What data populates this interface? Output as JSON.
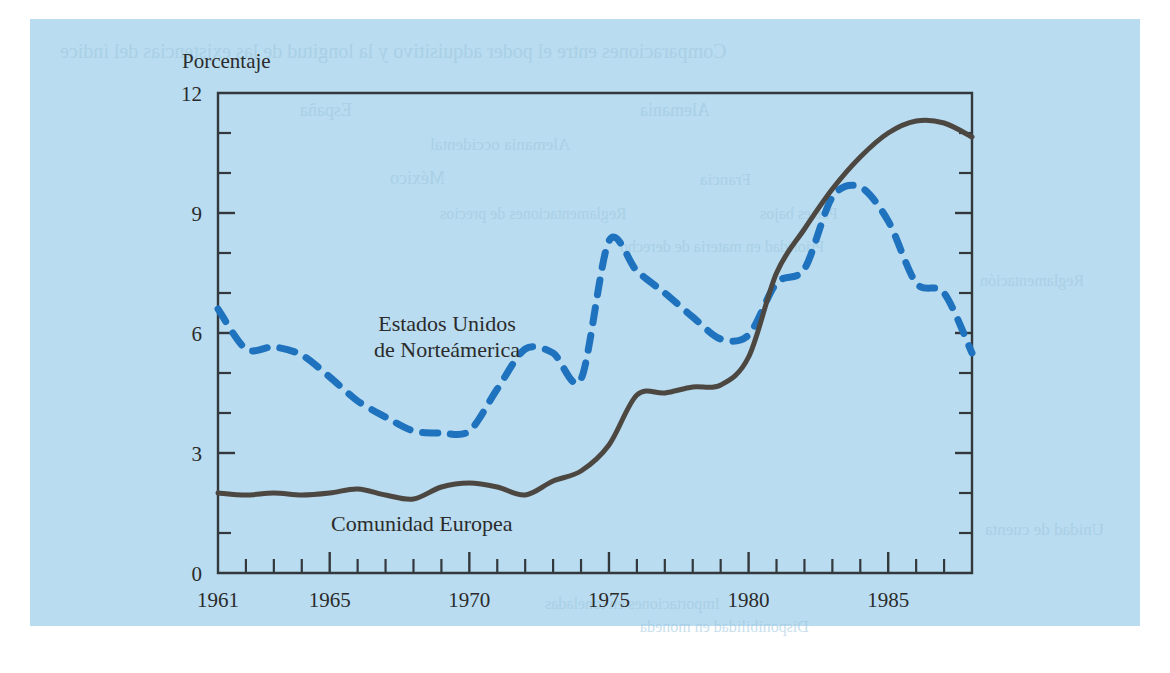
{
  "figure": {
    "background_color": "#b9dcf0",
    "page_color": "#ffffff",
    "axis_color": "#33383c"
  },
  "bleed_text": {
    "line1": "Comparaciones entre el poder adquisitivo y la longitud de las existencias del índice",
    "line2": "Alemania",
    "line3": "España",
    "line4": "Alemania occidental",
    "line5": "México",
    "line6": "Francia",
    "line7": "Reglamentaciones de precios",
    "line8": "Países bajos",
    "line9": "Prioridad en materia de derecho",
    "line10": "Reglamentación",
    "line11": "Unidad de cuenta",
    "line12": "Importaciones en toneladas",
    "line13": "Disponibilidad en moneda"
  },
  "chart_data": {
    "type": "line",
    "title": "",
    "ylabel": "Porcentaje",
    "xlabel": "",
    "xlim": [
      1961,
      1988
    ],
    "ylim": [
      0,
      12
    ],
    "yticks": [
      0,
      3,
      6,
      9,
      12
    ],
    "ytick_labels": [
      "0",
      "3",
      "6",
      "9",
      "12"
    ],
    "yminor_step": 1,
    "xtick_labels": [
      "1961",
      "1965",
      "1970",
      "1975",
      "1980",
      "1985"
    ],
    "xtick_label_years": [
      1961,
      1965,
      1970,
      1975,
      1980,
      1985
    ],
    "xminor_step": 1,
    "grid": false,
    "legend": "inline-annotations",
    "x": [
      1961,
      1962,
      1963,
      1964,
      1965,
      1966,
      1967,
      1968,
      1969,
      1970,
      1971,
      1972,
      1973,
      1974,
      1975,
      1976,
      1977,
      1978,
      1979,
      1980,
      1981,
      1982,
      1983,
      1984,
      1985,
      1986,
      1987,
      1988
    ],
    "series": [
      {
        "name": "Estados Unidos de Norteámerica",
        "style": "dashed",
        "color": "#1f72bd",
        "stroke_width": 7,
        "dash_pattern": "15 13",
        "label_x": 1969.2,
        "label_y": 6.05,
        "values": [
          6.6,
          5.6,
          5.65,
          5.45,
          4.9,
          4.3,
          3.9,
          3.55,
          3.5,
          3.55,
          4.6,
          5.6,
          5.5,
          4.85,
          8.3,
          7.55,
          7.0,
          6.4,
          5.85,
          5.95,
          7.25,
          7.6,
          9.4,
          9.65,
          8.8,
          7.25,
          7.0,
          5.5
        ]
      },
      {
        "name": "Comunidad Europea",
        "style": "solid",
        "color": "#4d4742",
        "stroke_width": 5,
        "label_x": 1968.3,
        "label_y": 1.05,
        "values": [
          2.0,
          1.95,
          2.0,
          1.95,
          2.0,
          2.1,
          1.95,
          1.85,
          2.15,
          2.25,
          2.15,
          1.95,
          2.3,
          2.55,
          3.2,
          4.45,
          4.5,
          4.65,
          4.7,
          5.4,
          7.5,
          8.6,
          9.6,
          10.4,
          11.0,
          11.3,
          11.25,
          10.9
        ]
      }
    ]
  }
}
